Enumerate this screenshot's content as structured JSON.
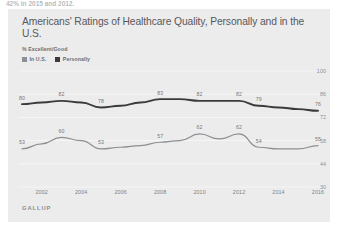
{
  "page": {
    "top_cut_text": "42% in 2015 and 2012."
  },
  "chart_data": {
    "type": "line",
    "title": "Americans' Ratings of Healthcare Quality, Personally and in the U.S.",
    "subtitle": "% Excellent/Good",
    "source": "GALLUP",
    "xlabel": "",
    "ylabel": "",
    "ylim": [
      30,
      100
    ],
    "yticks": [
      100,
      86,
      72,
      58,
      44,
      30
    ],
    "xticks": [
      2002,
      2004,
      2006,
      2008,
      2010,
      2012,
      2014,
      2016
    ],
    "x": [
      2001,
      2002,
      2003,
      2004,
      2005,
      2006,
      2007,
      2008,
      2009,
      2010,
      2011,
      2012,
      2013,
      2014,
      2015,
      2016
    ],
    "grid": true,
    "legend_position": "top-left",
    "colors": {
      "personally": "#3b3b3d",
      "in_us": "#8d8f93",
      "card_background": "#ececed",
      "title": "#58585b",
      "tick_text": "#8b8d91"
    },
    "series": [
      {
        "name": "Personally",
        "key": "personally",
        "color": "#3b3b3d",
        "values": [
          80,
          81,
          82,
          81,
          78,
          79,
          81,
          83,
          83,
          82,
          82,
          82,
          79,
          78,
          77,
          76
        ],
        "point_labels": [
          {
            "x": 2001,
            "value": 80
          },
          {
            "x": 2003,
            "value": 82
          },
          {
            "x": 2005,
            "value": 78
          },
          {
            "x": 2008,
            "value": 83
          },
          {
            "x": 2010,
            "value": 82
          },
          {
            "x": 2012,
            "value": 82
          },
          {
            "x": 2013,
            "value": 79
          },
          {
            "x": 2016,
            "value": 76
          }
        ]
      },
      {
        "name": "In U.S.",
        "key": "in_us",
        "color": "#8d8f93",
        "values": [
          53,
          56,
          60,
          58,
          53,
          54,
          55,
          57,
          58,
          62,
          59,
          62,
          54,
          53,
          53,
          55
        ],
        "point_labels": [
          {
            "x": 2001,
            "value": 53
          },
          {
            "x": 2003,
            "value": 60
          },
          {
            "x": 2005,
            "value": 53
          },
          {
            "x": 2008,
            "value": 57
          },
          {
            "x": 2010,
            "value": 62
          },
          {
            "x": 2012,
            "value": 62
          },
          {
            "x": 2013,
            "value": 54
          },
          {
            "x": 2016,
            "value": 55
          }
        ]
      }
    ],
    "legend": [
      {
        "label": "In U.S.",
        "color": "#8d8f93"
      },
      {
        "label": "Personally",
        "color": "#3b3b3d"
      }
    ]
  }
}
